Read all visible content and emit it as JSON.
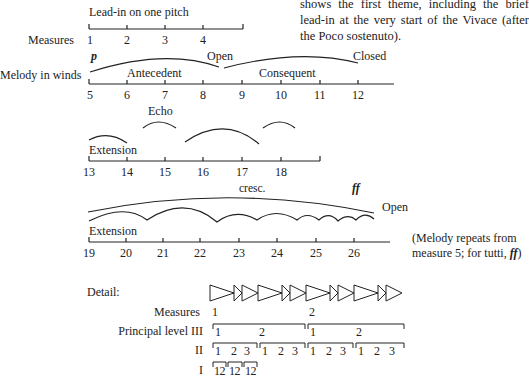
{
  "intro_text": "shows the first theme, including the brief lead-in at the very start of the Vivace (after the Poco sostenuto).",
  "row1": {
    "label": "Lead-in on one pitch",
    "axis_label": "Measures",
    "ticks": [
      "1",
      "2",
      "3",
      "4"
    ]
  },
  "row2": {
    "axis_label": "Melody in winds",
    "dynamic": "p",
    "phrase1": "Antecedent",
    "phrase1_end": "Open",
    "phrase2": "Consequent",
    "phrase2_end": "Closed",
    "ticks": [
      "5",
      "6",
      "7",
      "8",
      "9",
      "10",
      "11",
      "12"
    ]
  },
  "row3": {
    "label": "Extension",
    "echo": "Echo",
    "ticks": [
      "13",
      "14",
      "15",
      "16",
      "17",
      "18"
    ]
  },
  "row4": {
    "label": "Extension",
    "cresc": "cresc.",
    "dynamic": "ff",
    "end": "Open",
    "ticks": [
      "19",
      "20",
      "21",
      "22",
      "23",
      "24",
      "25",
      "26"
    ],
    "note_line1": "(Melody repeats from",
    "note_line2": "measure 5; for tutti,",
    "note_dynamic": "ff",
    "note_close": ")"
  },
  "detail": {
    "title": "Detail:",
    "measures_label": "Measures",
    "measures": [
      "1",
      "2"
    ],
    "level_III_label": "Principal level  III",
    "level_III": [
      "1",
      "2",
      "1",
      "2"
    ],
    "level_II_label": "II",
    "level_II": [
      "1",
      "2",
      "3",
      "1",
      "2",
      "3",
      "1",
      "2",
      "3",
      "1",
      "2",
      "3"
    ],
    "level_I_label": "I",
    "level_I": [
      "12",
      "12",
      "12"
    ]
  }
}
